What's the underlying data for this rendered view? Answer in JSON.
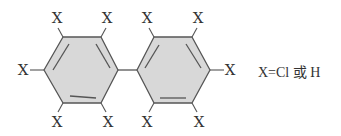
{
  "diagram": {
    "type": "chemical-structure",
    "molecule": "biphenyl-substituted",
    "substituent_label": "X",
    "legend": "X=Cl 或 H",
    "colors": {
      "ring_fill": "#d8d8d8",
      "bond": "#555555",
      "text": "#333333"
    },
    "rings": [
      {
        "name": "left-ring",
        "vertices": [
          [
            63,
            37
          ],
          [
            101,
            37
          ],
          [
            118,
            70
          ],
          [
            101,
            103
          ],
          [
            63,
            103
          ],
          [
            44,
            70
          ]
        ],
        "inner_double_bonds": [
          [
            [
              53,
              70
            ],
            [
              69,
              44
            ]
          ],
          [
            [
              96,
              44
            ],
            [
              110,
              68
            ]
          ],
          [
            [
              70,
              96
            ],
            [
              96,
              98
            ]
          ]
        ]
      },
      {
        "name": "right-ring",
        "vertices": [
          [
            154,
            37
          ],
          [
            192,
            37
          ],
          [
            210,
            70
          ],
          [
            192,
            103
          ],
          [
            154,
            103
          ],
          [
            137,
            70
          ]
        ],
        "inner_double_bonds": [
          [
            [
              145,
              68
            ],
            [
              159,
              45
            ]
          ],
          [
            [
              186,
              44
            ],
            [
              201,
              68
            ]
          ],
          [
            [
              160,
              98
            ],
            [
              186,
              98
            ]
          ]
        ]
      }
    ],
    "ring_link": [
      [
        118,
        70
      ],
      [
        137,
        70
      ]
    ],
    "substituents": [
      {
        "label": "X",
        "bond": [
          [
            63,
            37
          ],
          [
            58,
            28
          ]
        ],
        "pos": [
          57,
          23
        ]
      },
      {
        "label": "X",
        "bond": [
          [
            101,
            37
          ],
          [
            106,
            28
          ]
        ],
        "pos": [
          107,
          23
        ]
      },
      {
        "label": "X",
        "bond": [
          [
            44,
            70
          ],
          [
            30,
            70
          ]
        ],
        "pos": [
          23,
          75
        ]
      },
      {
        "label": "X",
        "bond": [
          [
            63,
            103
          ],
          [
            58,
            112
          ]
        ],
        "pos": [
          57,
          127
        ]
      },
      {
        "label": "X",
        "bond": [
          [
            101,
            103
          ],
          [
            106,
            112
          ]
        ],
        "pos": [
          108,
          127
        ]
      },
      {
        "label": "X",
        "bond": [
          [
            154,
            37
          ],
          [
            149,
            28
          ]
        ],
        "pos": [
          147,
          23
        ]
      },
      {
        "label": "X",
        "bond": [
          [
            192,
            37
          ],
          [
            197,
            28
          ]
        ],
        "pos": [
          198,
          23
        ]
      },
      {
        "label": "X",
        "bond": [
          [
            210,
            70
          ],
          [
            224,
            70
          ]
        ],
        "pos": [
          230,
          75
        ]
      },
      {
        "label": "X",
        "bond": [
          [
            154,
            103
          ],
          [
            149,
            112
          ]
        ],
        "pos": [
          147,
          127
        ]
      },
      {
        "label": "X",
        "bond": [
          [
            192,
            103
          ],
          [
            197,
            112
          ]
        ],
        "pos": [
          199,
          127
        ]
      }
    ]
  }
}
